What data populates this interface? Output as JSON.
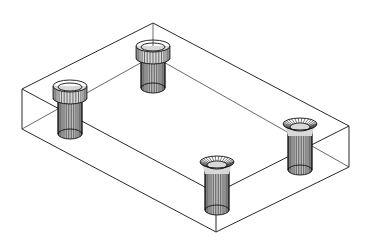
{
  "drawing": {
    "title": "Isometric wireframe of rectangular plate with four counterbored fasteners",
    "line_color": "#2a2a2a",
    "background": "#ffffff",
    "box": {
      "top": [
        [
          153,
          23
        ],
        [
          349,
          126
        ],
        [
          216,
          193
        ],
        [
          22,
          89
        ]
      ],
      "bottom": [
        [
          153,
          56
        ],
        [
          349,
          167
        ],
        [
          216,
          232
        ],
        [
          22,
          129
        ]
      ]
    },
    "fasteners": [
      {
        "name": "back",
        "cx": 153,
        "cap_top": 46,
        "cap_bottom": 58,
        "shaft_bottom": 88,
        "cap_rx": 17,
        "cap_ry": 6,
        "shaft_rx": 12,
        "style": "socket-head"
      },
      {
        "name": "left",
        "cx": 70,
        "cap_top": 86,
        "cap_bottom": 98,
        "shaft_bottom": 134,
        "cap_rx": 17,
        "cap_ry": 6,
        "shaft_rx": 12,
        "style": "socket-head"
      },
      {
        "name": "right",
        "cx": 300,
        "cap_top": 124,
        "cap_bottom": 132,
        "shaft_bottom": 170,
        "cap_rx": 17,
        "cap_ry": 6,
        "shaft_rx": 12,
        "style": "countersunk"
      },
      {
        "name": "front",
        "cx": 217,
        "cap_top": 162,
        "cap_bottom": 170,
        "shaft_bottom": 210,
        "cap_rx": 17,
        "cap_ry": 6,
        "shaft_rx": 12,
        "style": "countersunk"
      }
    ]
  }
}
